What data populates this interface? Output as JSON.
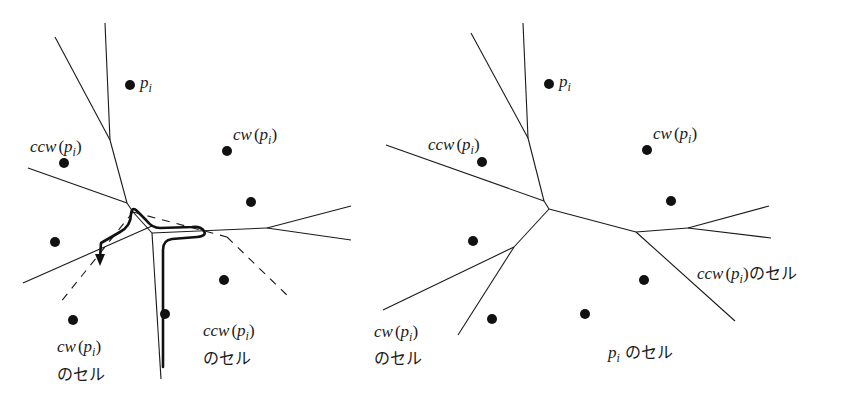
{
  "diagrams": [
    {
      "id": "left",
      "title": "",
      "sites": [
        {
          "x": 130,
          "y": 85,
          "label": "p_i"
        },
        {
          "x": 64,
          "y": 163,
          "label": "ccw(p_i)"
        },
        {
          "x": 227,
          "y": 151,
          "label": "cw(p_i)"
        },
        {
          "x": 251,
          "y": 202
        },
        {
          "x": 55,
          "y": 242
        },
        {
          "x": 224,
          "y": 280
        },
        {
          "x": 165,
          "y": 314
        },
        {
          "x": 73,
          "y": 320
        }
      ],
      "labels": {
        "pi": {
          "var": "p",
          "sub": "i"
        },
        "ccw_pi": {
          "prefix": "ccw",
          "open": "(",
          "var": "p",
          "sub": "i",
          "close": ")"
        },
        "cw_pi": {
          "prefix": "cw",
          "open": "(",
          "var": "p",
          "sub": "i",
          "close": ")"
        },
        "cw_cell": {
          "prefix": "cw",
          "open": "(",
          "var": "p",
          "sub": "i",
          "close": ")",
          "suffix": "のセル"
        },
        "ccw_cell": {
          "prefix": "ccw",
          "open": "(",
          "var": "p",
          "sub": "i",
          "close": ")",
          "suffix": "のセル"
        }
      }
    },
    {
      "id": "right",
      "sites": [
        {
          "x": 549,
          "y": 84,
          "label": "p_i"
        },
        {
          "x": 482,
          "y": 162,
          "label": "ccw(p_i)"
        },
        {
          "x": 647,
          "y": 150,
          "label": "cw(p_i)"
        },
        {
          "x": 671,
          "y": 201
        },
        {
          "x": 473,
          "y": 241
        },
        {
          "x": 644,
          "y": 280
        },
        {
          "x": 585,
          "y": 314
        },
        {
          "x": 492,
          "y": 319
        }
      ],
      "labels": {
        "pi": {
          "var": "p",
          "sub": "i"
        },
        "ccw_pi": {
          "prefix": "ccw",
          "open": "(",
          "var": "p",
          "sub": "i",
          "close": ")"
        },
        "cw_pi": {
          "prefix": "cw",
          "open": "(",
          "var": "p",
          "sub": "i",
          "close": ")"
        },
        "ccw_cell": {
          "prefix": "ccw",
          "open": "(",
          "var": "p",
          "sub": "i",
          "close": ")",
          "suffix": "のセル"
        },
        "cw_cell": {
          "prefix": "cw",
          "open": "(",
          "var": "p",
          "sub": "i",
          "close": ")",
          "suffix": "のセル"
        },
        "pi_cell": {
          "var": "p",
          "sub": "i",
          "suffix": " のセル"
        }
      }
    }
  ],
  "colors": {
    "ink": "#1a1a1a",
    "background": "#ffffff"
  }
}
